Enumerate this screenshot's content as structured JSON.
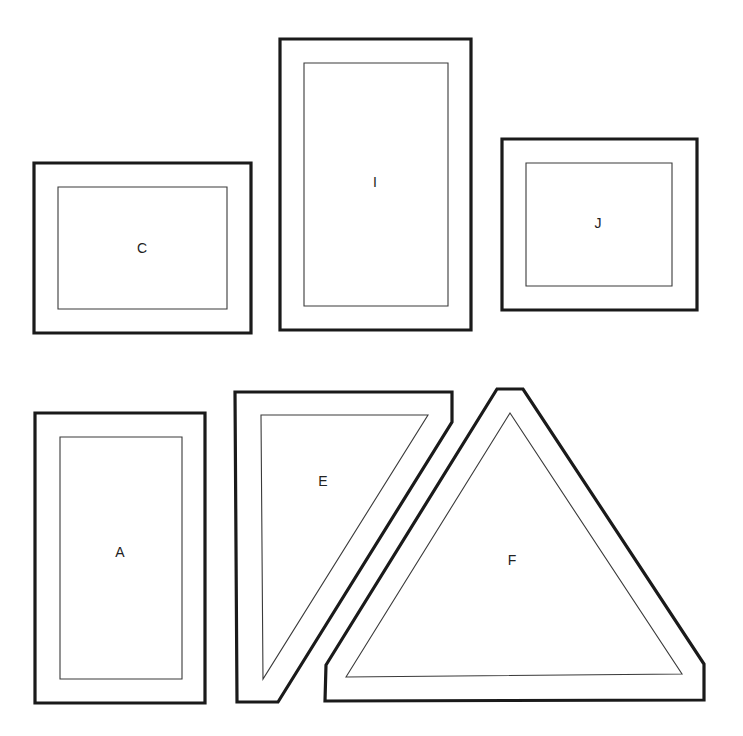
{
  "diagram": {
    "type": "template-pattern-pieces",
    "colors": {
      "outline": "#1a1a1a",
      "seam_line": "#3a3a3a",
      "background": "#ffffff",
      "label": "#222222"
    },
    "pieces": [
      {
        "id": "C",
        "label": "C",
        "shape": "rectangle",
        "outer": [
          [
            34,
            163
          ],
          [
            251,
            163
          ],
          [
            251,
            333
          ],
          [
            34,
            333
          ]
        ],
        "inner": [
          [
            58,
            187
          ],
          [
            227,
            187
          ],
          [
            227,
            309
          ],
          [
            58,
            309
          ]
        ],
        "label_pos": [
          142,
          249
        ]
      },
      {
        "id": "I",
        "label": "I",
        "shape": "rectangle",
        "outer": [
          [
            280,
            39
          ],
          [
            471,
            39
          ],
          [
            471,
            330
          ],
          [
            280,
            330
          ]
        ],
        "inner": [
          [
            304,
            63
          ],
          [
            448,
            63
          ],
          [
            448,
            306
          ],
          [
            304,
            306
          ]
        ],
        "label_pos": [
          375,
          183
        ]
      },
      {
        "id": "J",
        "label": "J",
        "shape": "rectangle",
        "outer": [
          [
            502,
            139
          ],
          [
            697,
            139
          ],
          [
            697,
            310
          ],
          [
            502,
            310
          ]
        ],
        "inner": [
          [
            526,
            163
          ],
          [
            672,
            163
          ],
          [
            672,
            286
          ],
          [
            526,
            286
          ]
        ],
        "label_pos": [
          598,
          224
        ]
      },
      {
        "id": "A",
        "label": "A",
        "shape": "rectangle",
        "outer": [
          [
            35,
            413
          ],
          [
            205,
            413
          ],
          [
            205,
            703
          ],
          [
            35,
            703
          ]
        ],
        "inner": [
          [
            60,
            437
          ],
          [
            182,
            437
          ],
          [
            182,
            679
          ],
          [
            60,
            679
          ]
        ],
        "label_pos": [
          120,
          553
        ]
      },
      {
        "id": "E",
        "label": "E",
        "shape": "right-triangle",
        "outer": [
          [
            235,
            392
          ],
          [
            452,
            392
          ],
          [
            452,
            422
          ],
          [
            278,
            702
          ],
          [
            237,
            702
          ]
        ],
        "inner": [
          [
            261,
            415
          ],
          [
            428,
            415
          ],
          [
            263,
            679
          ]
        ],
        "label_pos": [
          323,
          482
        ]
      },
      {
        "id": "F",
        "label": "F",
        "shape": "triangle",
        "outer": [
          [
            326,
            665
          ],
          [
            497,
            389
          ],
          [
            523,
            389
          ],
          [
            704,
            664
          ],
          [
            704,
            700
          ],
          [
            325,
            701
          ]
        ],
        "inner": [
          [
            346,
            677
          ],
          [
            510,
            413
          ],
          [
            682,
            674
          ]
        ],
        "label_pos": [
          512,
          561
        ]
      }
    ]
  }
}
